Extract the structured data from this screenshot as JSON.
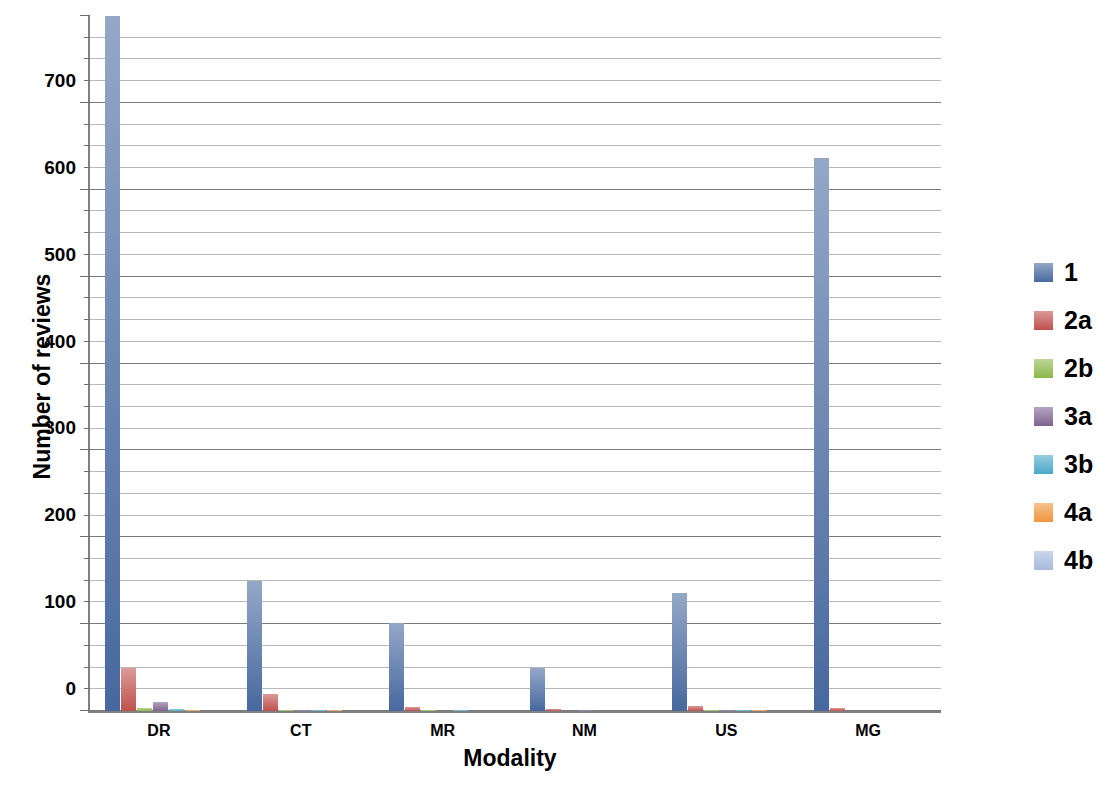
{
  "chart_data": {
    "type": "bar",
    "title": "",
    "xlabel": "Modality",
    "ylabel": "Number of reviews",
    "categories": [
      "DR",
      "CT",
      "MR",
      "NM",
      "US",
      "MG"
    ],
    "ylim": [
      0,
      800
    ],
    "y_ticks": [
      0,
      100,
      200,
      300,
      400,
      500,
      600,
      700,
      800
    ],
    "y_tick_labels": [
      "0",
      "100",
      "200",
      "300",
      "400",
      "500",
      "600",
      "700",
      "800"
    ],
    "minor_gridline_step": 25,
    "grid": true,
    "legend_position": "right",
    "series": [
      {
        "name": "1",
        "color": "#47689E",
        "values": [
          805,
          150,
          101,
          50,
          136,
          637
        ]
      },
      {
        "name": "2a",
        "color": "#C0504D",
        "values": [
          50,
          20,
          5,
          2,
          6,
          3
        ]
      },
      {
        "name": "2b",
        "color": "#8CB84B",
        "values": [
          4,
          1,
          1,
          0,
          1,
          0
        ]
      },
      {
        "name": "3a",
        "color": "#7F6391",
        "values": [
          10,
          1,
          0,
          1,
          1,
          0
        ]
      },
      {
        "name": "3b",
        "color": "#4AA8C8",
        "values": [
          2,
          1,
          1,
          0,
          1,
          0
        ]
      },
      {
        "name": "4a",
        "color": "#F0963C",
        "values": [
          1,
          1,
          0,
          0,
          1,
          0
        ]
      },
      {
        "name": "4b",
        "color": "#A7B9DD",
        "values": [
          0,
          0,
          0,
          0,
          0,
          0
        ]
      }
    ]
  },
  "axes": {
    "y_title": "Number of reviews",
    "x_title": "Modality"
  },
  "legend": {
    "items": [
      {
        "label": "1",
        "color": "#47689E"
      },
      {
        "label": "2a",
        "color": "#C0504D"
      },
      {
        "label": "2b",
        "color": "#8CB84B"
      },
      {
        "label": "3a",
        "color": "#7F6391"
      },
      {
        "label": "3b",
        "color": "#4AA8C8"
      },
      {
        "label": "4a",
        "color": "#F0963C"
      },
      {
        "label": "4b",
        "color": "#A7B9DD"
      }
    ]
  }
}
